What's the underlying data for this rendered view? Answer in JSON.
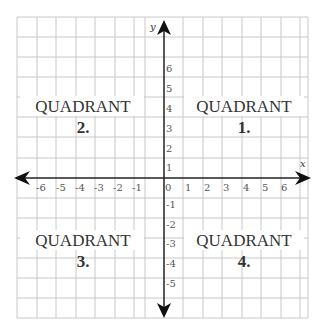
{
  "diagram": {
    "axes": {
      "x_label": "x",
      "y_label": "y",
      "origin_label": "0",
      "x_ticks": [
        "-6",
        "-5",
        "-4",
        "-3",
        "-2",
        "-1",
        "1",
        "2",
        "3",
        "4",
        "5",
        "6"
      ],
      "y_ticks_positive": [
        "1",
        "2",
        "3",
        "4",
        "5",
        "6"
      ],
      "y_ticks_negative": [
        "-1",
        "-2",
        "-3",
        "-4",
        "-5"
      ]
    },
    "quadrants": [
      {
        "word": "QUADRANT",
        "number": "1.",
        "position": "top-right"
      },
      {
        "word": "QUADRANT",
        "number": "2.",
        "position": "top-left"
      },
      {
        "word": "QUADRANT",
        "number": "3.",
        "position": "bottom-left"
      },
      {
        "word": "QUADRANT",
        "number": "4.",
        "position": "bottom-right"
      }
    ],
    "colors": {
      "grid": "#c8c8c8",
      "axis": "#222222",
      "text": "#333333"
    }
  }
}
